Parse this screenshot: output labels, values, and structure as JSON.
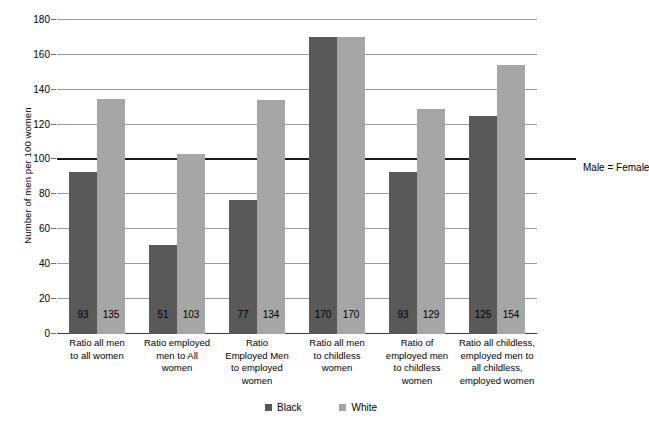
{
  "chart_data": {
    "type": "bar",
    "title": "",
    "xlabel": "",
    "ylabel": "Number of men per 100 women",
    "ylim": [
      0,
      180
    ],
    "ytick_step": 20,
    "yticks": [
      0,
      20,
      40,
      60,
      80,
      100,
      120,
      140,
      160,
      180
    ],
    "grid": true,
    "legend_position": "bottom",
    "categories": [
      "Ratio all men to all women",
      "Ratio employed men to All women",
      "Ratio Employed Men to employed women",
      "Ratio all men to childless women",
      "Ratio of employed men to childless women",
      "Ratio all childless, employed men to all childless, employed women"
    ],
    "category_lines": [
      [
        "Ratio all men",
        "to all women"
      ],
      [
        "Ratio employed",
        "men to All",
        "women"
      ],
      [
        "Ratio",
        "Employed Men",
        "to employed",
        "women"
      ],
      [
        "Ratio all men",
        "to childless",
        "women"
      ],
      [
        "Ratio of",
        "employed men",
        "to childless",
        "women"
      ],
      [
        "Ratio all childless,",
        "employed men to",
        "all childless,",
        "employed women"
      ]
    ],
    "series": [
      {
        "name": "Black",
        "color": "#595959",
        "values": [
          93,
          51,
          77,
          170,
          93,
          125
        ]
      },
      {
        "name": "White",
        "color": "#a6a6a6",
        "values": [
          135,
          103,
          134,
          170,
          129,
          154
        ]
      }
    ],
    "annotations": [
      {
        "name": "male-equals-female",
        "text": "Male = Female",
        "y": 100
      }
    ]
  },
  "legend": {
    "items": [
      {
        "label": "Black",
        "color": "#595959"
      },
      {
        "label": "White",
        "color": "#a6a6a6"
      }
    ]
  }
}
